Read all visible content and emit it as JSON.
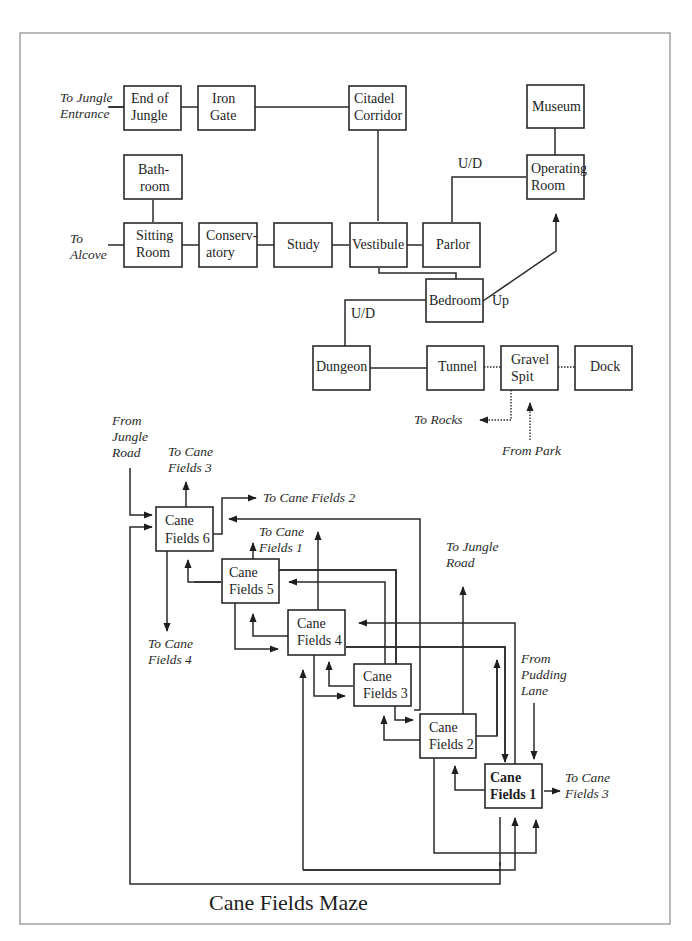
{
  "map": {
    "title": "Cane Fields Maze",
    "rooms": {
      "end_of_jungle": [
        "End of",
        "Jungle"
      ],
      "iron_gate": [
        "Iron",
        "Gate"
      ],
      "citadel_corridor": [
        "Citadel",
        "Corridor"
      ],
      "museum": [
        "Museum"
      ],
      "bathroom": [
        "Bath-",
        "room"
      ],
      "operating_room": [
        "Operating",
        "Room"
      ],
      "sitting_room": [
        "Sitting",
        "Room"
      ],
      "conservatory": [
        "Conserv-",
        "atory"
      ],
      "study": [
        "Study"
      ],
      "vestibule": [
        "Vestibule"
      ],
      "parlor": [
        "Parlor"
      ],
      "bedroom": [
        "Bedroom"
      ],
      "dungeon": [
        "Dungeon"
      ],
      "tunnel": [
        "Tunnel"
      ],
      "gravel_spit": [
        "Gravel",
        "Spit"
      ],
      "dock": [
        "Dock"
      ],
      "cane_fields_6": [
        "Cane",
        "Fields 6"
      ],
      "cane_fields_5": [
        "Cane",
        "Fields 5"
      ],
      "cane_fields_4": [
        "Cane",
        "Fields 4"
      ],
      "cane_fields_3": [
        "Cane",
        "Fields 3"
      ],
      "cane_fields_2": [
        "Cane",
        "Fields 2"
      ],
      "cane_fields_1": [
        "Cane",
        "Fields 1"
      ]
    },
    "connection_labels": {
      "parlor_operating": "U/D",
      "bedroom_dungeon": "U/D",
      "bedroom_up": "Up"
    },
    "exits": {
      "to_jungle_entrance": [
        "To Jungle",
        "Entrance"
      ],
      "to_alcove": [
        "To",
        "Alcove"
      ],
      "to_rocks": [
        "To Rocks"
      ],
      "from_park": [
        "From Park"
      ],
      "from_jungle_road": [
        "From",
        "Jungle",
        "Road"
      ],
      "cf6_to_cf3": [
        "To Cane",
        "Fields 3"
      ],
      "cf6_to_cf2": [
        "To Cane Fields 2"
      ],
      "cf5_to_cf1": [
        "To Cane",
        "Fields 1"
      ],
      "cf6_to_cf4": [
        "To Cane",
        "Fields 4"
      ],
      "to_jungle_road": [
        "To Jungle",
        "Road"
      ],
      "from_pudding_lane": [
        "From",
        "Pudding",
        "Lane"
      ],
      "cf1_to_cf3": [
        "To Cane",
        "Fields 3"
      ]
    }
  }
}
